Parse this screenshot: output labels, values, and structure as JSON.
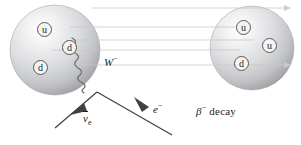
{
  "figure": {
    "caption": {
      "symbol": "β",
      "superscript": "−",
      "word": "decay",
      "full": "β− decay"
    }
  },
  "colors": {
    "sphere_light": "#fdfdfd",
    "sphere_mid": "#d7d8da",
    "sphere_dark": "#a7a9ac",
    "sphere_edge": "#8c8e90",
    "line_gray": "#bcbec0",
    "stroke_dark": "#58585a",
    "text": "#231f20",
    "quark_fill": "#f4f4f4"
  },
  "nucleons": [
    {
      "name": "neutron",
      "side": "left",
      "cx": 55,
      "cy": 50,
      "r": 45,
      "quarks": [
        {
          "flavor": "u",
          "x": 37,
          "y": 22
        },
        {
          "flavor": "d",
          "x": 62,
          "y": 40
        },
        {
          "flavor": "d",
          "x": 33,
          "y": 60
        }
      ]
    },
    {
      "name": "proton",
      "side": "right",
      "cx": 252,
      "cy": 48,
      "r": 42,
      "quarks": [
        {
          "flavor": "u",
          "x": 236,
          "y": 20
        },
        {
          "flavor": "u",
          "x": 262,
          "y": 38
        },
        {
          "flavor": "d",
          "x": 234,
          "y": 56
        }
      ]
    }
  ],
  "spectator_lines": [
    {
      "id": "line-1",
      "y": 8,
      "x1": 92,
      "x2": 296,
      "arrow": true
    },
    {
      "id": "line-2",
      "y": 27,
      "x1": 70,
      "x2": 240,
      "arrow": false
    },
    {
      "id": "line-3",
      "y": 40,
      "x1": 74,
      "x2": 252,
      "arrow": false
    },
    {
      "id": "line-4",
      "y": 50,
      "x1": 52,
      "x2": 240,
      "arrow": false
    },
    {
      "id": "line-5",
      "y": 65,
      "x1": 82,
      "x2": 296,
      "arrow": true
    }
  ],
  "boson": {
    "label": "W",
    "superscript": "−",
    "label_full": "W−",
    "label_x": 104,
    "label_y": 55,
    "start_x": 74,
    "start_y": 40,
    "end_x": 97,
    "end_y": 92
  },
  "products": [
    {
      "name": "antineutrino",
      "symbol": "ν",
      "overbar": true,
      "subscript": "e",
      "label_full": "ν̄e",
      "label_x": 83,
      "label_y": 117,
      "from_x": 97,
      "from_y": 92,
      "to_x": 55,
      "to_y": 128,
      "arrow_at_x": 77,
      "arrow_at_y": 111
    },
    {
      "name": "electron",
      "symbol": "e",
      "superscript": "−",
      "label_full": "e−",
      "label_x": 153,
      "label_y": 107,
      "from_x": 97,
      "from_y": 92,
      "to_x": 170,
      "to_y": 134,
      "arrow_at_x": 143,
      "arrow_at_y": 103
    }
  ]
}
